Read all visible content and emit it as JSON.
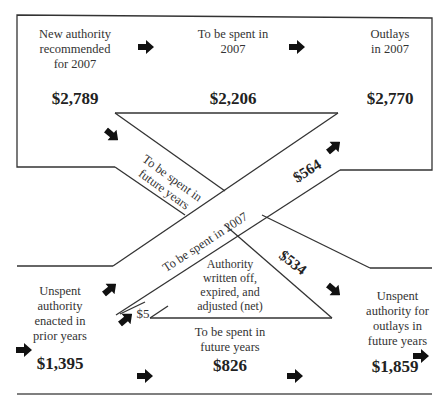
{
  "diagram": {
    "nodes": {
      "new_authority": {
        "label": "New authority\nrecommended\nfor 2007",
        "amount": "$2,789"
      },
      "spent_2007": {
        "label": "To be spent in\n2007",
        "amount": "$2,206"
      },
      "outlays_2007": {
        "label": "Outlays\nin 2007",
        "amount": "$2,770"
      },
      "unspent_prior": {
        "label": "Unspent\nauthority\nenacted in\nprior years",
        "amount": "$1,395"
      },
      "spent_future": {
        "label": "To be spent in\nfuture years",
        "amount": "$826"
      },
      "unspent_future": {
        "label": "Unspent\nauthority for\noutlays in\nfuture years",
        "amount": "$1,859"
      },
      "written_off": {
        "label": "Authority\nwritten off,\nexpired, and\nadjusted (net)",
        "amount": "$5"
      }
    },
    "flows": {
      "future_band_label": "To be spent in\nfuture years",
      "future_band_amount": "$534",
      "band_2007_label": "To be spent  in 2007",
      "band_2007_amount": "$564"
    },
    "colors": {
      "line": "#333333",
      "arrow": "#111111",
      "background": "#ffffff"
    }
  }
}
